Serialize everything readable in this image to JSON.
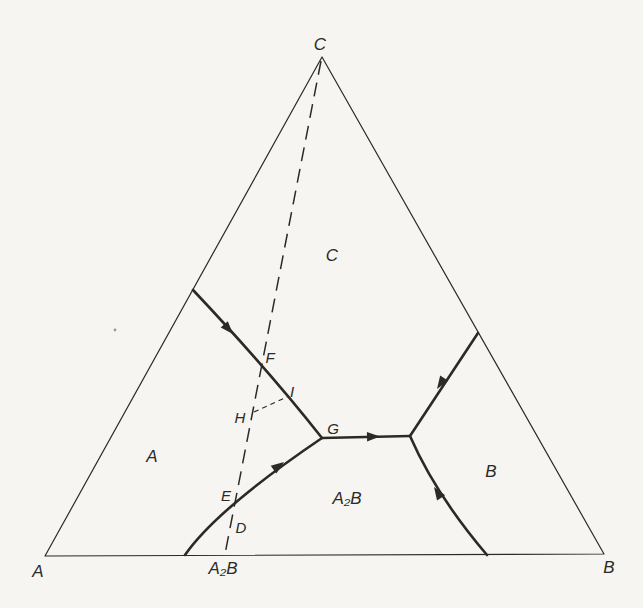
{
  "figure": {
    "type": "ternary-phase-diagram",
    "vertex_labels": {
      "top": "C",
      "bottom_left": "A",
      "bottom_right": "B",
      "bottom_mid_compound": "A₂B"
    },
    "region_labels": {
      "c_field": "C",
      "a_field": "A",
      "b_field": "B",
      "a2b_field": "A₂B"
    },
    "point_labels": {
      "d": "D",
      "e": "E",
      "f": "F",
      "g": "G",
      "h": "H",
      "i": "I"
    }
  },
  "colors": {
    "background": "#f6f5f1",
    "ink": "#2b2a27"
  }
}
